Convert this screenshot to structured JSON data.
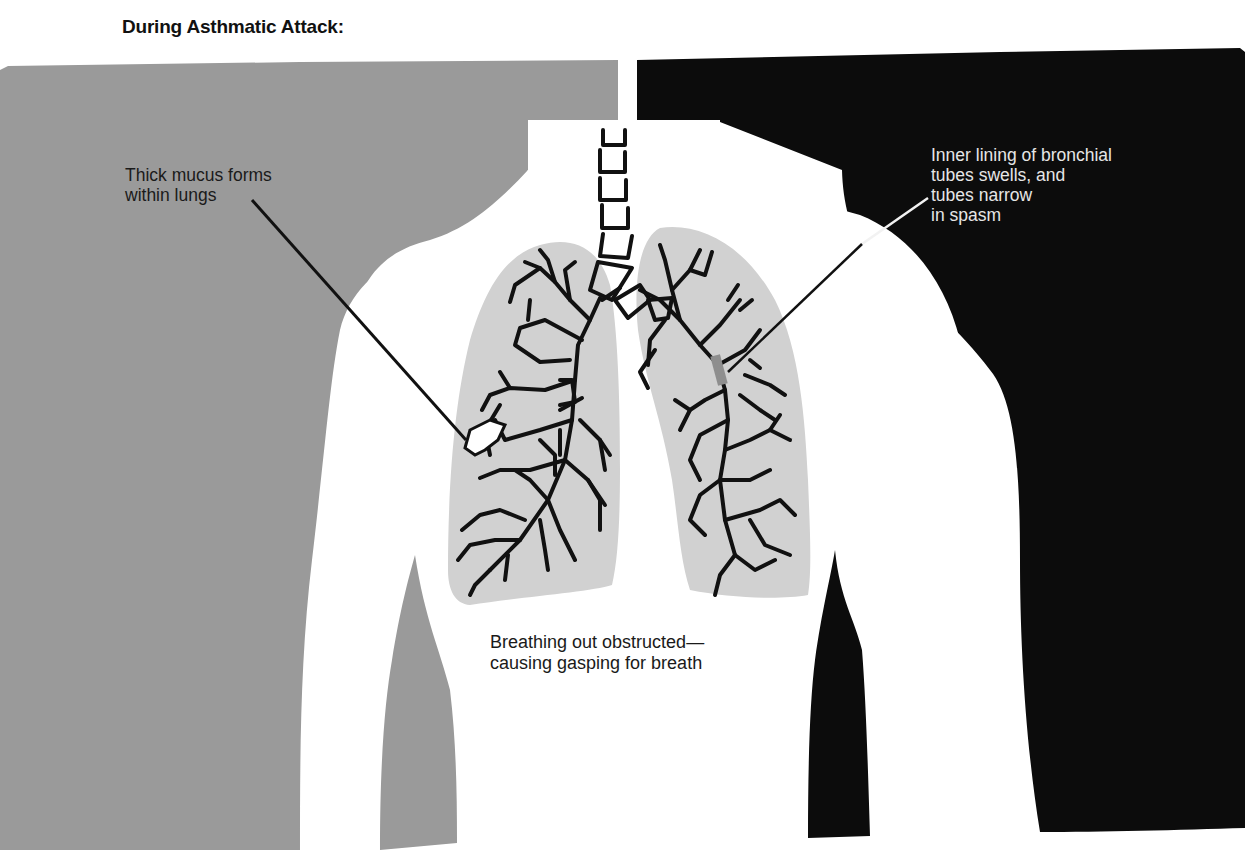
{
  "figure": {
    "title": "During Asthmatic Attack:",
    "callouts": [
      {
        "id": "mucus",
        "text": "Thick mucus forms\nwithin lungs",
        "lines": [
          "Thick mucus forms",
          "within lungs"
        ],
        "text_color": "#1a1a1a",
        "leader_color": "#111111"
      },
      {
        "id": "bronchial-lining",
        "text": "Inner lining of bronchial\ntubes swells, and\ntubes narrow\nin spasm",
        "lines": [
          "Inner lining of bronchial",
          "tubes swells, and",
          "tubes narrow",
          "in spasm"
        ],
        "text_color": "#e6e6e6",
        "leader_color": "#f2f2f2"
      }
    ],
    "caption": "Breathing out obstructed—\ncausing gasping for breath",
    "caption_lines": [
      "Breathing out obstructed—",
      "causing gasping for breath"
    ]
  },
  "colors": {
    "background": "#ffffff",
    "left_panel": "#9a9a9a",
    "right_panel": "#0c0c0c",
    "body": "#ffffff",
    "lung_fill": "#d1d1d1",
    "airway_stroke": "#111111"
  }
}
